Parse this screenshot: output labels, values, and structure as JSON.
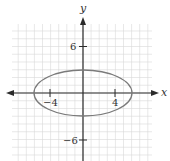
{
  "figure": {
    "type": "ellipse-graph",
    "x_axis_label": "x",
    "y_axis_label": "y",
    "tick_labels": {
      "x_neg": "−4",
      "x_pos": "4",
      "y_pos": "6",
      "y_neg": "−6"
    },
    "ellipse": {
      "center": [
        0,
        0
      ],
      "semi_axis_x": 6,
      "semi_axis_y": 3,
      "equation": "x^2/36 + y^2/9 = 1"
    },
    "grid": {
      "unit_step": 1,
      "x_range": [
        -9,
        9
      ],
      "y_range": [
        -9,
        9
      ]
    },
    "colors": {
      "grid": "#d9d9d9",
      "axis": "#2b2b2b",
      "curve": "#7a7a7a"
    }
  }
}
